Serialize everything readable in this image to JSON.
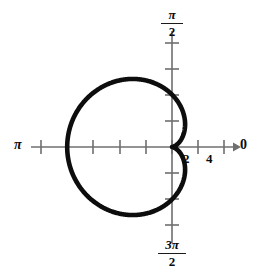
{
  "figure": {
    "kind": "polar-plot",
    "background_color": "#ffffff",
    "curve_color": "#0d0d0d",
    "axis_color": "#6f6f6f",
    "label_color": "#0a0a0a"
  },
  "labels": {
    "angle_zero": "0",
    "angle_pi": "π",
    "angle_pi_half_numerator": "π",
    "angle_pi_half_denominator": "2",
    "angle_3pi_half_numerator": "3π",
    "angle_3pi_half_denominator": "2",
    "radial_tick_2": "2",
    "radial_tick_4": "4"
  },
  "chart_data": {
    "type": "line",
    "coordinate_system": "polar",
    "title": "",
    "xlabel": "",
    "ylabel": "",
    "equation": "r = 2(1 - cos(theta))",
    "curve_name": "cardioid",
    "cusp_at": "origin",
    "opens_toward": "pi",
    "max_radius": 4,
    "angle_axis_labels": [
      "0",
      "π/2",
      "π",
      "3π/2"
    ],
    "radial_tick_labels": [
      "2",
      "4"
    ],
    "radial_tick_values": [
      2,
      4
    ],
    "radial_ticks_drawn_every": 1,
    "radial_axis_max": 5,
    "grid": false,
    "legend": false,
    "series": [
      {
        "name": "r = 2(1 - cos theta)",
        "theta_degrees": [
          0,
          15,
          30,
          45,
          60,
          75,
          90,
          105,
          120,
          135,
          150,
          165,
          180,
          195,
          210,
          225,
          240,
          255,
          270,
          285,
          300,
          315,
          330,
          345,
          360
        ],
        "r_values": [
          0.0,
          0.068,
          0.268,
          0.586,
          1.0,
          1.482,
          2.0,
          2.518,
          3.0,
          3.414,
          3.732,
          3.932,
          4.0,
          3.932,
          3.732,
          3.414,
          3.0,
          2.518,
          2.0,
          1.482,
          1.0,
          0.586,
          0.268,
          0.068,
          0.0
        ]
      }
    ]
  }
}
